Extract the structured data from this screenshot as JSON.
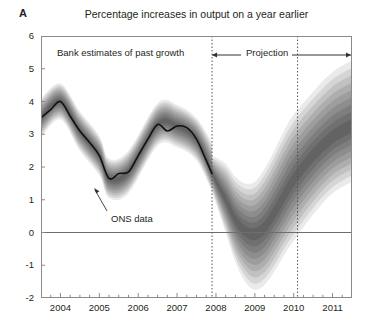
{
  "panel": {
    "letter": "A"
  },
  "chart_title": "Percentage increases in output on a year earlier",
  "annotations": {
    "past_growth": "Bank estimates of past growth",
    "projection": "Projection",
    "ons_data": "ONS data"
  },
  "axes": {
    "y_ticks": [
      "6",
      "5",
      "4",
      "3",
      "2",
      "1",
      "0",
      "-1",
      "-2"
    ],
    "x_ticks": [
      "2004",
      "2005",
      "2006",
      "2007",
      "2008",
      "2009",
      "2010",
      "2011"
    ]
  },
  "chart_data": {
    "type": "area",
    "title": "Percentage increases in output on a year earlier",
    "subtitle": "GDP projection based on market interest rate expectations (fan chart)",
    "xlabel": "",
    "ylabel": "Percentage increases in output on a year earlier",
    "xlim": [
      2003.5,
      2011.5
    ],
    "ylim": [
      -2,
      6
    ],
    "ytick_values": [
      6,
      5,
      4,
      3,
      2,
      1,
      0,
      -1,
      -2
    ],
    "xtick_values": [
      2004,
      2005,
      2006,
      2007,
      2008,
      2009,
      2010,
      2011
    ],
    "xtick_minor_interval": 0.25,
    "grid": false,
    "zero_line": 0,
    "legend": "none",
    "vertical_markers": [
      {
        "x": 2007.9,
        "style": "dotted",
        "label": "start of projection"
      },
      {
        "x": 2010.1,
        "style": "dotted",
        "label": "two-year horizon"
      }
    ],
    "region_labels": [
      {
        "text": "Bank estimates of past growth",
        "x_start": 2003.5,
        "x_end": 2007.9
      },
      {
        "text": "Projection",
        "x_start": 2007.9,
        "x_end": 2011.5
      }
    ],
    "series": [
      {
        "name": "ONS data",
        "type": "line",
        "color": "#111111",
        "x": [
          2003.5,
          2003.75,
          2004.0,
          2004.25,
          2004.5,
          2004.75,
          2005.0,
          2005.25,
          2005.5,
          2005.75,
          2006.0,
          2006.25,
          2006.5,
          2006.75,
          2007.0,
          2007.25,
          2007.5,
          2007.75,
          2007.9
        ],
        "values": [
          3.5,
          3.75,
          4.0,
          3.55,
          3.1,
          2.75,
          2.35,
          1.65,
          1.8,
          1.85,
          2.35,
          2.85,
          3.3,
          3.1,
          3.25,
          3.2,
          2.85,
          2.2,
          1.8
        ]
      },
      {
        "name": "Central projection (mode)",
        "type": "line",
        "color": "#404040",
        "x": [
          2007.9,
          2008.25,
          2008.5,
          2008.75,
          2009.0,
          2009.25,
          2009.5,
          2009.75,
          2010.0,
          2010.25,
          2010.5,
          2010.75,
          2011.0,
          2011.25,
          2011.5
        ],
        "values": [
          1.8,
          1.0,
          0.4,
          0.05,
          -0.05,
          0.15,
          0.6,
          1.1,
          1.6,
          2.0,
          2.35,
          2.65,
          2.9,
          3.1,
          3.25
        ]
      }
    ],
    "fan_bands": {
      "description": "Nested probability bands around the central projection, shading darkest at the centre and fading outward; 90% coverage at the widest band",
      "probability_steps": [
        10,
        20,
        30,
        40,
        50,
        60,
        70,
        80,
        90
      ],
      "history_band": {
        "x": [
          2003.5,
          2004.0,
          2004.5,
          2005.0,
          2005.25,
          2005.75,
          2006.5,
          2007.0,
          2007.5,
          2007.9
        ],
        "upper_90": [
          4.1,
          4.55,
          3.7,
          2.95,
          2.25,
          2.5,
          3.95,
          3.9,
          3.5,
          2.75
        ],
        "lower_90": [
          2.9,
          3.45,
          2.5,
          1.75,
          1.05,
          1.2,
          2.65,
          2.6,
          2.2,
          1.25
        ]
      },
      "projection_band": {
        "x": [
          2007.9,
          2008.25,
          2008.5,
          2008.75,
          2009.0,
          2009.25,
          2009.5,
          2009.75,
          2010.0,
          2010.5,
          2011.0,
          2011.5
        ],
        "upper_90": [
          2.35,
          2.1,
          1.7,
          1.5,
          1.55,
          1.95,
          2.5,
          3.1,
          3.6,
          4.3,
          4.9,
          5.25
        ],
        "lower_90": [
          1.25,
          0.0,
          -0.9,
          -1.5,
          -1.75,
          -1.6,
          -1.2,
          -0.7,
          -0.25,
          0.55,
          1.2,
          1.55
        ]
      }
    }
  }
}
